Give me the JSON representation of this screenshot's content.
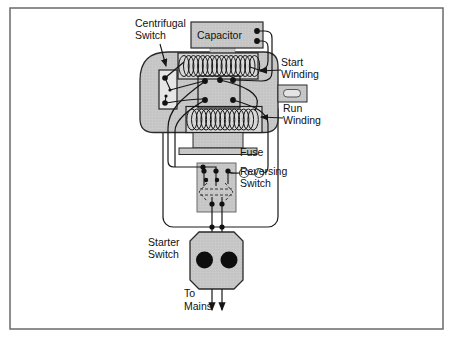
{
  "diagram": {
    "type": "motor-wiring-diagram",
    "labels": {
      "centrifugal": [
        "Centrifugal",
        "Switch"
      ],
      "capacitor": "Capacitor",
      "start_winding": [
        "Start",
        "Winding"
      ],
      "run_winding": [
        "Run",
        "Winding"
      ],
      "fuse": "Fuse",
      "reversing": [
        "Reversing",
        "Switch"
      ],
      "starter": [
        "Starter",
        "Switch"
      ],
      "to_mains": [
        "To",
        "Mains"
      ]
    },
    "colors": {
      "component_gray": "#c9c9c9",
      "winding_backing": "#d8d8d8",
      "line_black": "#161616",
      "background": "#ffffff",
      "frame_border": "#6a6a6a",
      "button_black": "#0d0d0d"
    }
  }
}
